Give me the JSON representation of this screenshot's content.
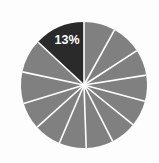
{
  "chart_data": {
    "type": "pie",
    "title": "",
    "subtitle": "",
    "xlabel": "",
    "ylabel": "",
    "grid": false,
    "legend_position": "none",
    "background_color": "#fdfdfd",
    "divider_color": "#ffffff",
    "highlight_color": "#2a2a2a",
    "base_color": "#808080",
    "label_color": "#ffffff",
    "center": {
      "x": 84,
      "y": 85
    },
    "radius": 63,
    "start_angle_deg": 0,
    "direction": "counterclockwise",
    "labels_shown": [
      "13%"
    ],
    "categories": [
      "Segment 1",
      "Segment 2",
      "Segment 3",
      "Segment 4",
      "Segment 5",
      "Segment 6",
      "Segment 7",
      "Segment 8",
      "Segment 9",
      "Segment 10",
      "Segment 11",
      "Segment 12",
      "Segment 13"
    ],
    "values": [
      13,
      9,
      8,
      7,
      7,
      7,
      7,
      7,
      7,
      7,
      7,
      7,
      7
    ],
    "slices": [
      {
        "name": "Segment 1",
        "value": 13,
        "label": "13%",
        "color": "#2a2a2a",
        "highlighted": true,
        "start_deg": 0,
        "sweep_deg": 47
      },
      {
        "name": "Segment 2",
        "value": 9,
        "label": "",
        "color": "#808080",
        "highlighted": false,
        "start_deg": 47,
        "sweep_deg": 31
      },
      {
        "name": "Segment 3",
        "value": 8,
        "label": "",
        "color": "#808080",
        "highlighted": false,
        "start_deg": 78,
        "sweep_deg": 29
      },
      {
        "name": "Segment 4",
        "value": 7,
        "label": "",
        "color": "#808080",
        "highlighted": false,
        "start_deg": 107,
        "sweep_deg": 25
      },
      {
        "name": "Segment 5",
        "value": 7,
        "label": "",
        "color": "#808080",
        "highlighted": false,
        "start_deg": 132,
        "sweep_deg": 25
      },
      {
        "name": "Segment 6",
        "value": 7,
        "label": "",
        "color": "#808080",
        "highlighted": false,
        "start_deg": 157,
        "sweep_deg": 25
      },
      {
        "name": "Segment 7",
        "value": 7,
        "label": "",
        "color": "#808080",
        "highlighted": false,
        "start_deg": 182,
        "sweep_deg": 25
      },
      {
        "name": "Segment 8",
        "value": 7,
        "label": "",
        "color": "#808080",
        "highlighted": false,
        "start_deg": 207,
        "sweep_deg": 24
      },
      {
        "name": "Segment 9",
        "value": 7,
        "label": "",
        "color": "#808080",
        "highlighted": false,
        "start_deg": 231,
        "sweep_deg": 24
      },
      {
        "name": "Segment 10",
        "value": 7,
        "label": "",
        "color": "#808080",
        "highlighted": false,
        "start_deg": 255,
        "sweep_deg": 24
      },
      {
        "name": "Segment 11",
        "value": 7,
        "label": "",
        "color": "#808080",
        "highlighted": false,
        "start_deg": 279,
        "sweep_deg": 24
      },
      {
        "name": "Segment 12",
        "value": 7,
        "label": "",
        "color": "#808080",
        "highlighted": false,
        "start_deg": 303,
        "sweep_deg": 28
      },
      {
        "name": "Segment 13",
        "value": 7,
        "label": "",
        "color": "#808080",
        "highlighted": false,
        "start_deg": 331,
        "sweep_deg": 29
      }
    ],
    "label_positions": [
      {
        "label": "13%",
        "x": 67,
        "y": 44
      }
    ]
  }
}
